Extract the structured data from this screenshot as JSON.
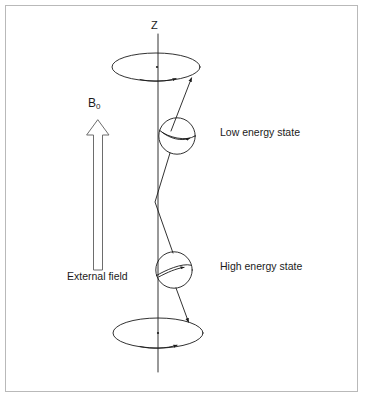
{
  "figure": {
    "background_color": "#ffffff",
    "stroke_color": "#1b1b1b",
    "border_color": "#b9b9b9",
    "axis_label": "Z",
    "field_symbol": "B",
    "field_subscript": "0",
    "external_field_label": "External field",
    "low_state_label": "Low energy state",
    "high_state_label": "High energy state"
  },
  "diagram_data": {
    "type": "schematic",
    "axis": {
      "name": "Z",
      "x": 158,
      "y_top": 28,
      "y_bottom": 372
    },
    "field_arrow": {
      "label": "B0",
      "caption": "External field",
      "direction": "up",
      "tip_x": 98,
      "tip_y": 120,
      "tail_x": 98,
      "tail_y": 270,
      "style": "hollow-outline"
    },
    "cones": [
      {
        "name": "upper-precession-ellipse",
        "cx": 156,
        "cy": 67,
        "rx": 44,
        "ry": 14,
        "arrow_direction": "clockwise"
      },
      {
        "name": "lower-precession-ellipse",
        "cx": 158,
        "cy": 333,
        "rx": 45,
        "ry": 15,
        "arrow_direction": "clockwise"
      }
    ],
    "spins": [
      {
        "name": "low-energy-spin",
        "cx": 177,
        "cy": 136,
        "r": 18,
        "label": "Low energy state",
        "orientation": "up"
      },
      {
        "name": "high-energy-spin",
        "cx": 174,
        "cy": 270,
        "r": 18,
        "label": "High energy state",
        "orientation": "down"
      }
    ],
    "vectors": [
      {
        "name": "upper-spin-vector",
        "from": [
          172,
          132
        ],
        "to": [
          192,
          78
        ],
        "arrow": "at-end"
      },
      {
        "name": "upper-to-mid-vector",
        "from": [
          170,
          152
        ],
        "to": [
          155,
          202
        ],
        "arrow": "none"
      },
      {
        "name": "mid-to-lower-vector",
        "from": [
          155,
          202
        ],
        "to": [
          172,
          252
        ],
        "arrow": "none"
      },
      {
        "name": "lower-spin-vector",
        "from": [
          176,
          288
        ],
        "to": [
          189,
          323
        ],
        "arrow": "at-end"
      }
    ]
  }
}
